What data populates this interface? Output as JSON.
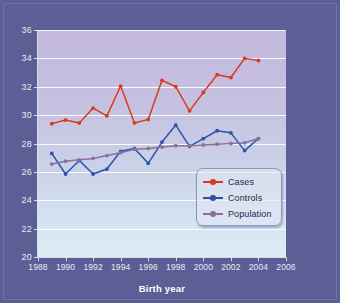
{
  "chart_data": {
    "type": "line",
    "title": "",
    "xlabel": "Birth year",
    "ylabel": "Mean maternal age",
    "xlim": [
      1988,
      2006
    ],
    "ylim": [
      20,
      36
    ],
    "xticks": [
      1988,
      1990,
      1992,
      1994,
      1996,
      1998,
      2000,
      2002,
      2004,
      2006
    ],
    "yticks": [
      20,
      22,
      24,
      26,
      28,
      30,
      32,
      34,
      36
    ],
    "grid": "horizontal",
    "legend_position": "lower-right-inside",
    "x": [
      1989,
      1990,
      1991,
      1992,
      1993,
      1994,
      1995,
      1996,
      1997,
      1998,
      1999,
      2000,
      2001,
      2002,
      2003,
      2004
    ],
    "series": [
      {
        "name": "Cases",
        "color": "#d93a1e",
        "marker": "circle",
        "values": [
          29.4,
          29.65,
          29.45,
          30.5,
          29.95,
          32.05,
          29.45,
          29.7,
          32.45,
          32.0,
          30.3,
          31.6,
          32.85,
          32.65,
          34.0,
          33.85
        ]
      },
      {
        "name": "Controls",
        "color": "#2b52ab",
        "marker": "circle",
        "values": [
          27.3,
          25.85,
          26.8,
          25.85,
          26.2,
          27.45,
          27.65,
          26.6,
          28.1,
          29.3,
          27.8,
          28.35,
          28.9,
          28.75,
          27.5,
          28.35
        ]
      },
      {
        "name": "Population",
        "color": "#8b6f9e",
        "marker": "circle",
        "values": [
          26.55,
          26.75,
          26.85,
          26.95,
          27.15,
          27.35,
          27.6,
          27.65,
          27.75,
          27.85,
          27.85,
          27.9,
          27.95,
          28.0,
          28.05,
          28.35
        ]
      }
    ]
  },
  "legend": {
    "items": [
      {
        "label": "Cases"
      },
      {
        "label": "Controls"
      },
      {
        "label": "Population"
      }
    ]
  },
  "colors": {
    "figure_background": "#5b5f96",
    "plot_top": "#c3bade",
    "plot_bottom": "#dcecf5",
    "gridline": "#ffffff",
    "axis_text": "#e8e9f4",
    "axis_title": "#ffffff",
    "cases": "#d93a1e",
    "controls": "#2b52ab",
    "population": "#8b6f9e"
  }
}
